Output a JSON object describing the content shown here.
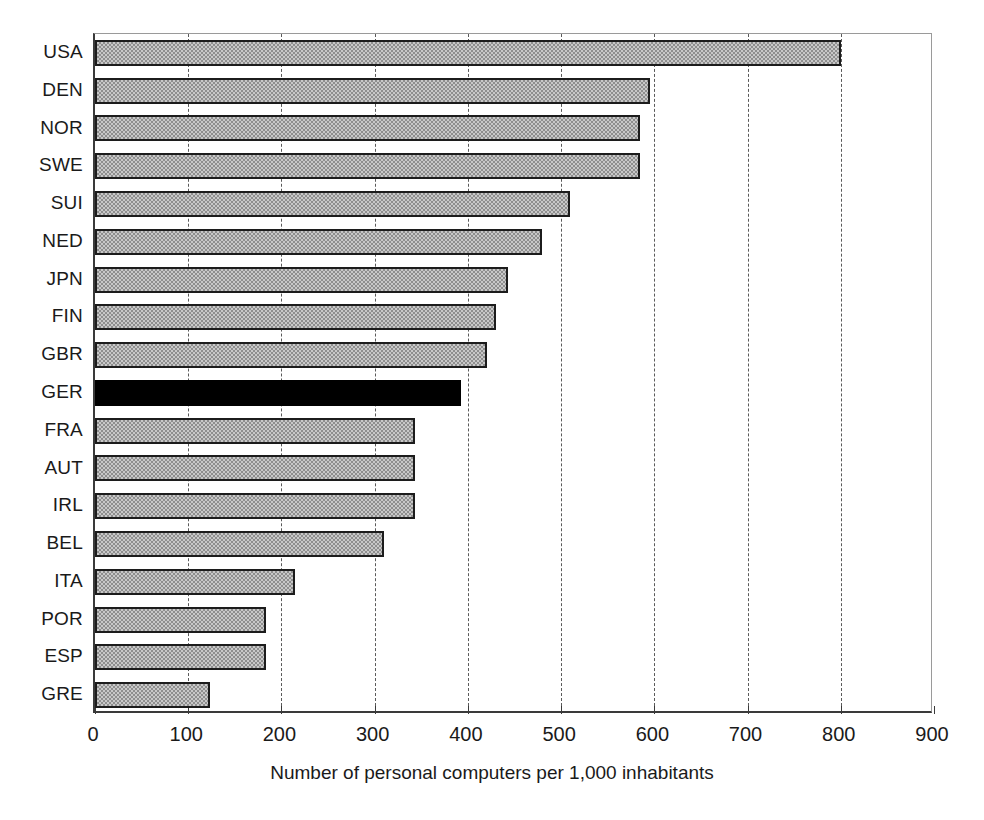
{
  "chart_data": {
    "type": "bar",
    "orientation": "horizontal",
    "title": "",
    "subtitle": "",
    "xlabel": "Number of personal computers per 1,000 inhabitants",
    "ylabel": "",
    "xlim": [
      0,
      900
    ],
    "xticks": [
      0,
      100,
      200,
      300,
      400,
      500,
      600,
      700,
      800,
      900
    ],
    "xtick_labels": [
      "0",
      "100",
      "200",
      "300",
      "400",
      "500",
      "600",
      "700",
      "800",
      "900"
    ],
    "grid": "vertical-dashed",
    "legend": "none",
    "categories": [
      "USA",
      "DEN",
      "NOR",
      "SWE",
      "SUI",
      "NED",
      "JPN",
      "FIN",
      "GBR",
      "GER",
      "FRA",
      "AUT",
      "IRL",
      "BEL",
      "ITA",
      "POR",
      "ESP",
      "GRE"
    ],
    "values": [
      800,
      595,
      585,
      585,
      510,
      480,
      443,
      430,
      420,
      393,
      343,
      343,
      343,
      310,
      215,
      183,
      183,
      123
    ],
    "highlight_category": "GER",
    "bars": [
      {
        "label": "USA",
        "value": 800,
        "highlight": false
      },
      {
        "label": "DEN",
        "value": 595,
        "highlight": false
      },
      {
        "label": "NOR",
        "value": 585,
        "highlight": false
      },
      {
        "label": "SWE",
        "value": 585,
        "highlight": false
      },
      {
        "label": "SUI",
        "value": 510,
        "highlight": false
      },
      {
        "label": "NED",
        "value": 480,
        "highlight": false
      },
      {
        "label": "JPN",
        "value": 443,
        "highlight": false
      },
      {
        "label": "FIN",
        "value": 430,
        "highlight": false
      },
      {
        "label": "GBR",
        "value": 420,
        "highlight": false
      },
      {
        "label": "GER",
        "value": 393,
        "highlight": true
      },
      {
        "label": "FRA",
        "value": 343,
        "highlight": false
      },
      {
        "label": "AUT",
        "value": 343,
        "highlight": false
      },
      {
        "label": "IRL",
        "value": 343,
        "highlight": false
      },
      {
        "label": "BEL",
        "value": 310,
        "highlight": false
      },
      {
        "label": "ITA",
        "value": 215,
        "highlight": false
      },
      {
        "label": "POR",
        "value": 183,
        "highlight": false
      },
      {
        "label": "ESP",
        "value": 183,
        "highlight": false
      },
      {
        "label": "GRE",
        "value": 123,
        "highlight": false
      }
    ],
    "colors": {
      "bar_fill": "#c8c8c8",
      "bar_pattern": "#8e8e8e",
      "bar_border": "#1c1c1c",
      "highlight_fill": "#000000",
      "gridline": "#5a5a5a",
      "axis": "#3a3a3a",
      "background": "#ffffff",
      "text": "#1a1a1a"
    }
  }
}
